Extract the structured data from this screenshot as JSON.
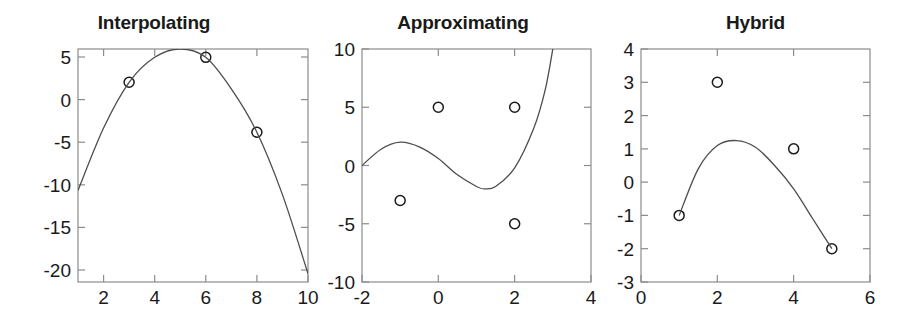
{
  "figure": {
    "background_color": "#ffffff",
    "axis_color": "#8c8c8c",
    "curve_color": "#4d4d4d",
    "marker_color": "#1a1a1a",
    "text_color": "#1a1a1a"
  },
  "panels": [
    {
      "title": "Interpolating",
      "xticks": [
        "2",
        "4",
        "6",
        "8",
        "10"
      ],
      "yticks": [
        "5",
        "0",
        "-5",
        "-10",
        "-15",
        "-20"
      ]
    },
    {
      "title": "Approximating",
      "xticks": [
        "-2",
        "0",
        "2",
        "4"
      ],
      "yticks": [
        "10",
        "5",
        "0",
        "-5",
        "-10"
      ]
    },
    {
      "title": "Hybrid",
      "xticks": [
        "0",
        "2",
        "4",
        "6"
      ],
      "yticks": [
        "4",
        "3",
        "2",
        "1",
        "0",
        "-1",
        "-2",
        "-3"
      ]
    }
  ],
  "chart_data": [
    {
      "type": "scatter",
      "title": "Interpolating",
      "xlabel": "",
      "ylabel": "",
      "xlim": [
        1,
        10
      ],
      "ylim": [
        -22,
        6
      ],
      "xticks": [
        2,
        4,
        6,
        8,
        10
      ],
      "yticks": [
        5,
        0,
        -5,
        -10,
        -15,
        -20
      ],
      "grid": false,
      "legend": "none",
      "series": [
        {
          "name": "data points",
          "marker": "open-circle",
          "x": [
            3,
            6,
            8
          ],
          "y": [
            2,
            5,
            -4
          ]
        },
        {
          "name": "interpolating curve",
          "type": "line",
          "note": "downward parabola through all data points, vertex near x=5, y=6",
          "x": [
            1,
            2,
            3,
            4,
            5,
            6,
            7,
            8,
            9,
            10
          ],
          "y": [
            -11,
            -3.5,
            2,
            5,
            6,
            5,
            1.2,
            -4,
            -11.5,
            -21
          ]
        }
      ]
    },
    {
      "type": "scatter",
      "title": "Approximating",
      "xlabel": "",
      "ylabel": "",
      "xlim": [
        -2,
        4
      ],
      "ylim": [
        -10,
        10
      ],
      "xticks": [
        -2,
        0,
        2,
        4
      ],
      "yticks": [
        10,
        5,
        0,
        -5,
        -10
      ],
      "grid": false,
      "legend": "none",
      "series": [
        {
          "name": "data points",
          "marker": "open-circle",
          "x": [
            -1,
            0,
            2,
            2
          ],
          "y": [
            -3,
            5,
            5,
            -5
          ]
        },
        {
          "name": "approximating curve",
          "type": "line",
          "note": "cubic-like curve: starts at (-2,0), local max (-1,2), local min (1.2,-2), rises steeply and exits top near x=3",
          "x": [
            -2,
            -1.5,
            -1,
            -0.5,
            0,
            0.5,
            1,
            1.2,
            1.5,
            2,
            2.5,
            2.8,
            3
          ],
          "y": [
            0,
            1.4,
            2,
            1.6,
            0.6,
            -0.8,
            -1.8,
            -2,
            -1.8,
            -0.2,
            3.2,
            6.5,
            10
          ]
        }
      ]
    },
    {
      "type": "scatter",
      "title": "Hybrid",
      "xlabel": "",
      "ylabel": "",
      "xlim": [
        0,
        6
      ],
      "ylim": [
        -3,
        4
      ],
      "xticks": [
        0,
        2,
        4,
        6
      ],
      "yticks": [
        4,
        3,
        2,
        1,
        0,
        -1,
        -2,
        -3
      ],
      "grid": false,
      "legend": "none",
      "series": [
        {
          "name": "data points",
          "marker": "open-circle",
          "x": [
            1,
            2,
            4,
            5
          ],
          "y": [
            -1,
            3,
            1,
            -2
          ]
        },
        {
          "name": "hybrid curve",
          "type": "line",
          "note": "downward parabola from (1,-1), vertex near (2.5,1.25), to (5,-2); passes through first and last points only",
          "x": [
            1,
            1.5,
            2,
            2.5,
            3,
            3.5,
            4,
            4.5,
            5
          ],
          "y": [
            -1,
            0.4,
            1.1,
            1.25,
            1.05,
            0.5,
            -0.2,
            -1.1,
            -2
          ]
        }
      ]
    }
  ]
}
